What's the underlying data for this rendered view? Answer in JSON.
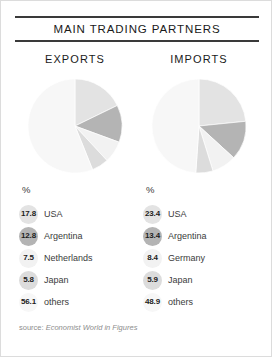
{
  "header": {
    "title": "MAIN TRADING PARTNERS"
  },
  "columns": {
    "exports_heading": "EXPORTS",
    "imports_heading": "IMPORTS"
  },
  "legend": {
    "percent_symbol": "%"
  },
  "footer": {
    "source_prefix": "source: ",
    "source_title": "Economist World in Figures"
  },
  "colors": {
    "slice_usa": "#e3e3e3",
    "slice_second": "#b4b4b4",
    "slice_third": "#f2f2f2",
    "slice_fourth": "#dcdcdc",
    "slice_others": "#f7f7f7",
    "rule": "#3a3a3a",
    "text": "#3b3b3b",
    "source_text": "#8d8d8d"
  },
  "chart_data": [
    {
      "type": "pie",
      "title": "EXPORTS",
      "subtitle": "MAIN TRADING PARTNERS",
      "unit": "%",
      "legend_position": "below",
      "grid": false,
      "categories": [
        "USA",
        "Argentina",
        "Netherlands",
        "Japan",
        "others"
      ],
      "values": [
        17.8,
        12.8,
        7.5,
        5.8,
        56.1
      ],
      "labels": [
        "17.8",
        "12.8",
        "7.5",
        "5.8",
        "56.1"
      ],
      "slice_colors": [
        "#e3e3e3",
        "#b4b4b4",
        "#f2f2f2",
        "#dcdcdc",
        "#f7f7f7"
      ],
      "start_angle_deg": 0,
      "direction": "clockwise"
    },
    {
      "type": "pie",
      "title": "IMPORTS",
      "subtitle": "MAIN TRADING PARTNERS",
      "unit": "%",
      "legend_position": "below",
      "grid": false,
      "categories": [
        "USA",
        "Argentina",
        "Germany",
        "Japan",
        "others"
      ],
      "values": [
        23.4,
        13.4,
        8.4,
        5.9,
        48.9
      ],
      "labels": [
        "23.4",
        "13.4",
        "8.4",
        "5.9",
        "48.9"
      ],
      "slice_colors": [
        "#e3e3e3",
        "#b4b4b4",
        "#f2f2f2",
        "#dcdcdc",
        "#f7f7f7"
      ],
      "start_angle_deg": 0,
      "direction": "clockwise"
    }
  ]
}
